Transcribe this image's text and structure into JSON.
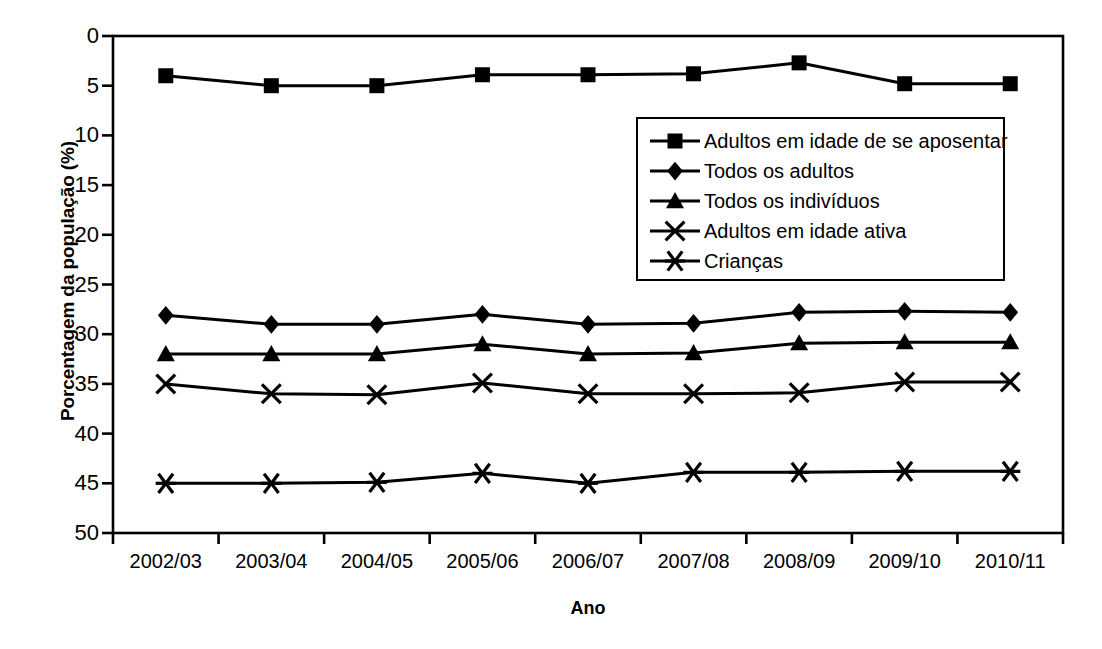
{
  "chart_data": {
    "type": "line",
    "title": "",
    "xlabel": "Ano",
    "ylabel": "Porcentagem da população (%)",
    "categories": [
      "2002/03",
      "2003/04",
      "2004/05",
      "2005/06",
      "2006/07",
      "2007/08",
      "2008/09",
      "2009/10",
      "2010/11"
    ],
    "ylim": [
      0,
      50
    ],
    "yticks": [
      0,
      5,
      10,
      15,
      20,
      25,
      30,
      35,
      40,
      45,
      50
    ],
    "grid": false,
    "legend_position": "upper-center-right",
    "series": [
      {
        "name": "Adultos em idade de se aposentar",
        "marker": "square",
        "values": [
          46.0,
          45.0,
          45.0,
          46.1,
          46.1,
          46.2,
          47.3,
          45.2,
          45.2
        ]
      },
      {
        "name": "Todos os adultos",
        "marker": "diamond",
        "values": [
          21.9,
          21.0,
          21.0,
          22.0,
          21.0,
          21.1,
          22.2,
          22.3,
          22.2
        ]
      },
      {
        "name": "Todos os indivíduos",
        "marker": "triangle",
        "values": [
          18.0,
          18.0,
          18.0,
          19.0,
          18.0,
          18.1,
          19.1,
          19.2,
          19.2
        ]
      },
      {
        "name": "Adultos em idade ativa",
        "marker": "cross",
        "values": [
          15.0,
          14.0,
          13.9,
          15.1,
          14.0,
          14.0,
          14.1,
          15.2,
          15.2
        ]
      },
      {
        "name": "Crianças",
        "marker": "asterisk",
        "values": [
          5.0,
          5.0,
          5.1,
          6.0,
          5.0,
          6.1,
          6.1,
          6.2,
          6.2
        ]
      }
    ]
  },
  "axis": {
    "y_title": "Porcentagem da população (%)",
    "x_title": "Ano",
    "y_ticks": [
      "50",
      "45",
      "40",
      "35",
      "30",
      "25",
      "20",
      "15",
      "10",
      "5",
      "0"
    ],
    "x_ticks": [
      "2002/03",
      "2003/04",
      "2004/05",
      "2005/06",
      "2006/07",
      "2007/08",
      "2008/09",
      "2009/10",
      "2010/11"
    ]
  },
  "legend": {
    "items": [
      {
        "label": "Adultos em idade de se aposentar",
        "marker": "square"
      },
      {
        "label": "Todos os adultos",
        "marker": "diamond"
      },
      {
        "label": "Todos os indivíduos",
        "marker": "triangle"
      },
      {
        "label": "Adultos em idade ativa",
        "marker": "cross"
      },
      {
        "label": "Crianças",
        "marker": "asterisk"
      }
    ]
  },
  "style": {
    "line_color": "#000000",
    "frame_color": "#000000",
    "background": "#ffffff"
  }
}
